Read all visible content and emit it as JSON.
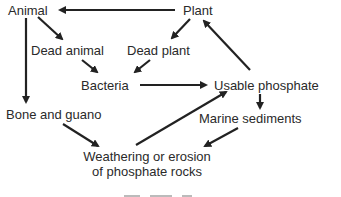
{
  "diagram": {
    "title_partial": "",
    "nodes": {
      "animal": "Animal",
      "plant": "Plant",
      "dead_animal": "Dead animal",
      "dead_plant": "Dead plant",
      "bacteria": "Bacteria",
      "usable_phosphate": "Usable phosphate",
      "bone_and_guano": "Bone and guano",
      "marine_sediments": "Marine sediments",
      "weathering_line1": "Weathering or erosion",
      "weathering_line2": "of phosphate rocks"
    },
    "edges": [
      {
        "from": "Plant",
        "to": "Animal"
      },
      {
        "from": "Animal",
        "to": "Dead animal"
      },
      {
        "from": "Plant",
        "to": "Dead plant"
      },
      {
        "from": "Dead animal",
        "to": "Bacteria"
      },
      {
        "from": "Dead plant",
        "to": "Bacteria"
      },
      {
        "from": "Bacteria",
        "to": "Usable phosphate"
      },
      {
        "from": "Usable phosphate",
        "to": "Plant"
      },
      {
        "from": "Animal",
        "to": "Bone and guano"
      },
      {
        "from": "Usable phosphate",
        "to": "Marine sediments"
      },
      {
        "from": "Bone and guano",
        "to": "Weathering or erosion of phosphate rocks"
      },
      {
        "from": "Marine sediments",
        "to": "Weathering or erosion of phosphate rocks"
      },
      {
        "from": "Weathering or erosion of phosphate rocks",
        "to": "Usable phosphate"
      }
    ],
    "colors": {
      "ink": "#222222",
      "background": "#ffffff"
    }
  }
}
